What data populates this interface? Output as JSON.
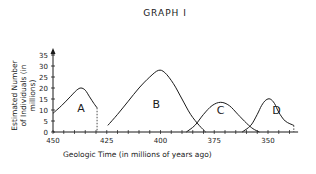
{
  "chart_data": {
    "type": "line",
    "title": "GRAPH I",
    "xlabel": "Geologic Time (in millions of years ago)",
    "ylabel": "Estimated Number of Individuals (in millions)",
    "x_ticks": [
      450,
      425,
      400,
      375,
      350
    ],
    "y_ticks": [
      0,
      5,
      10,
      15,
      20,
      25,
      30,
      35
    ],
    "xlim": [
      450,
      336
    ],
    "ylim": [
      0,
      35
    ],
    "x_reversed": true,
    "grid": false,
    "legend": "none",
    "series": [
      {
        "name": "A",
        "x": [
          450,
          446,
          442,
          439,
          437,
          435,
          433,
          431,
          429.5
        ],
        "y": [
          8.5,
          12,
          16,
          19,
          20,
          19,
          16,
          13,
          11
        ],
        "end_marker": "dotted drop to x-axis at 429.5"
      },
      {
        "name": "B",
        "x": [
          424.5,
          420,
          415,
          410,
          405,
          401,
          398,
          394,
          390,
          386,
          382,
          379
        ],
        "y": [
          3,
          8,
          14,
          20,
          25,
          28,
          27,
          22,
          15,
          8,
          3,
          0
        ]
      },
      {
        "name": "C",
        "x": [
          388,
          384,
          380,
          376,
          372,
          368,
          364,
          360,
          357,
          354
        ],
        "y": [
          0,
          3,
          8,
          12,
          13.5,
          12,
          8,
          4,
          1.5,
          0
        ]
      },
      {
        "name": "D",
        "x": [
          362,
          358,
          355,
          353,
          351,
          349,
          347,
          345,
          342,
          338
        ],
        "y": [
          0,
          3,
          8,
          12,
          14.5,
          15,
          13,
          9,
          5,
          3
        ],
        "end_marker": "dotted drop to x-axis at 338"
      }
    ],
    "annotations": [
      "A",
      "B",
      "C",
      "D"
    ]
  },
  "labels": {
    "title": "GRAPH I",
    "ylabel_line1": "Estimated Number",
    "ylabel_line2": "of Individuals (in millions)",
    "xlabel": "Geologic Time  (in millions of years ago)",
    "curve_a": "A",
    "curve_b": "B",
    "curve_c": "C",
    "curve_d": "D"
  }
}
